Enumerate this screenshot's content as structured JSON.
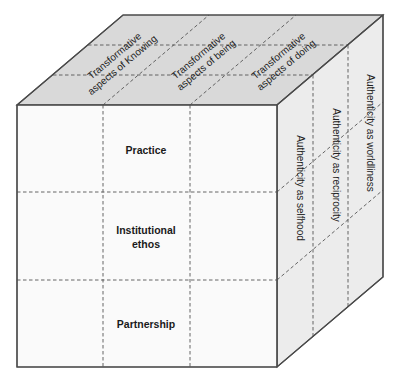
{
  "diagram": {
    "type": "cube-matrix",
    "faces": {
      "front": {
        "fill": "#fafafa",
        "rows": [
          {
            "label": "Practice"
          },
          {
            "label_line1": "Institutional",
            "label_line2": "ethos"
          },
          {
            "label": "Partnership"
          }
        ]
      },
      "top": {
        "fill": "#d9d9d9",
        "columns": [
          {
            "line1": "Transformative",
            "line2": "aspects of Knowing"
          },
          {
            "line1": "Transformative",
            "line2": "aspects of being"
          },
          {
            "line1": "Transformative",
            "line2": "aspects of doing"
          }
        ]
      },
      "side": {
        "fill": "#ececec",
        "layers": [
          {
            "label": "Authenticity as selfhood"
          },
          {
            "label": "Authenticity as reciprocity"
          },
          {
            "label": "Authenticity as worldliness"
          }
        ]
      }
    },
    "colors": {
      "edge": "#4a4a4a",
      "dashed": "#555555",
      "background": "#ffffff"
    }
  }
}
